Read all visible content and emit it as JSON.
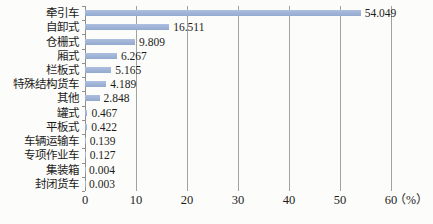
{
  "chart_data": {
    "type": "bar",
    "orientation": "horizontal",
    "title": "",
    "categories": [
      "牵引车",
      "自卸式",
      "仓栅式",
      "厢式",
      "栏板式",
      "特殊结构货车",
      "其他",
      "罐式",
      "平板式",
      "车辆运输车",
      "专项作业车",
      "集装箱",
      "封闭货车"
    ],
    "values": [
      54.049,
      16.511,
      9.809,
      6.267,
      5.165,
      4.189,
      2.848,
      0.467,
      0.422,
      0.139,
      0.127,
      0.004,
      0.003
    ],
    "value_labels": [
      "54.049",
      "16.511",
      "9.809",
      "6.267",
      "5.165",
      "4.189",
      "2.848",
      "0.467",
      "0.422",
      "0.139",
      "0.127",
      "0.004",
      "0.003"
    ],
    "xlabel": "（%）",
    "x_ticks": [
      "0",
      "10",
      "20",
      "30",
      "40",
      "50",
      "60"
    ],
    "xlim": [
      0,
      60
    ],
    "grid": "vertical-gridlines",
    "legend": "none",
    "colors": {
      "bar_top": "#aebfe0",
      "bar_bottom": "#93a9ce",
      "gridline": "#a2a2a2",
      "axis": "#8f8f8f",
      "text": "#1c1c1c",
      "background": "#fcfcfa"
    }
  }
}
